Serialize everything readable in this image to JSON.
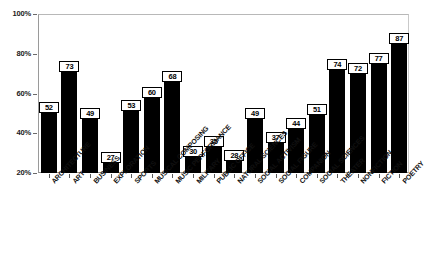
{
  "chart_data": {
    "type": "bar",
    "title": "",
    "subtitle": "",
    "xlabel": "",
    "ylabel": "",
    "ylim": [
      20,
      100
    ],
    "grid": false,
    "legend": null,
    "orientation": "vertical",
    "bar_color": "#000000",
    "value_labels_shown": true,
    "ytick_labels": [
      "20%",
      "40%",
      "60%",
      "80%",
      "100%"
    ],
    "ytick_values": [
      20,
      40,
      60,
      80,
      100
    ],
    "categories": [
      "ARCHITECTURE",
      "ART",
      "BUSINESS",
      "EXPLORATION",
      "SPORTS",
      "MUSICAL COMPOSING",
      "MUSIC PERFORMANCE",
      "MILITARY",
      "PUBLIC OFFICE",
      "NATURAL SCIENCES",
      "SOCIAL ACTIVISM",
      "SOCIAL FIGURE",
      "COMPANION",
      "SOCIAL SCIENCES",
      "THEATER",
      "NONFICTION",
      "FICTION",
      "POETRY"
    ],
    "values": [
      52,
      73,
      49,
      27,
      53,
      60,
      68,
      30,
      35,
      28,
      49,
      37,
      44,
      51,
      74,
      72,
      77,
      87
    ]
  }
}
